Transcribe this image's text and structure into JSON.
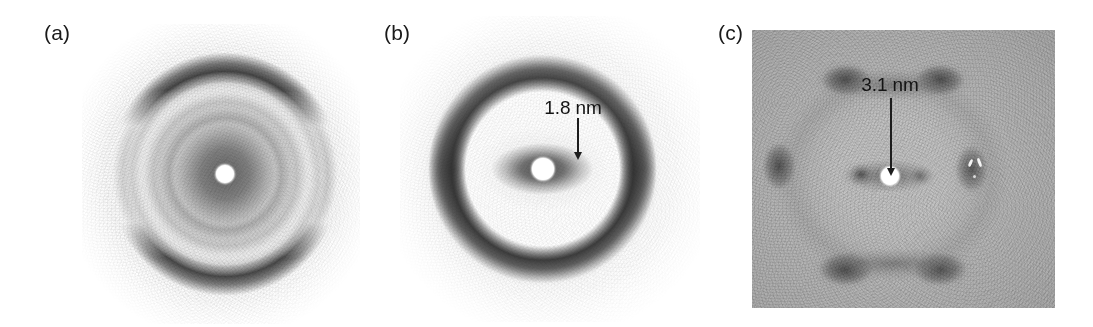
{
  "figure": {
    "background": "#ffffff",
    "width": 1093,
    "height": 327,
    "kind": "three-panel fibre X-ray diffraction patterns"
  },
  "panels": [
    {
      "id": "a",
      "label": "(a)",
      "label_x": 44,
      "label_y": 22,
      "image": {
        "x": 82,
        "y": 24,
        "w": 278,
        "h": 300
      },
      "background": "#f5f5f5",
      "edge": "soft",
      "beamstop": {
        "cx": 0.515,
        "cy": 0.5,
        "r": 9,
        "color": "#ffffff"
      },
      "description": "diffuse concentric rings with broad meridional arcs",
      "annotation": null
    },
    {
      "id": "b",
      "label": "(b)",
      "label_x": 384,
      "label_y": 22,
      "image": {
        "x": 400,
        "y": 16,
        "w": 300,
        "h": 306
      },
      "background": "#fdfdfd",
      "edge": "soft",
      "beamstop": {
        "cx": 0.475,
        "cy": 0.5,
        "r": 11,
        "color": "#ffffff"
      },
      "description": "strong outer ring with heavy top and bottom meridional arcs and a dark equatorial lobe",
      "annotation": {
        "text": "1.8 nm",
        "text_x": 573,
        "text_y": 98,
        "arrow_x": 578,
        "arrow_y": 118,
        "arrow_length": 42
      }
    },
    {
      "id": "c",
      "label": "(c)",
      "label_x": 718,
      "label_y": 22,
      "image": {
        "x": 752,
        "y": 30,
        "w": 303,
        "h": 278
      },
      "background": "#b4b4b4",
      "edge": "hard",
      "beamstop": {
        "cx": 0.455,
        "cy": 0.525,
        "r": 9,
        "color": "#ffffff"
      },
      "description": "hexagonal six-spot single-crystal-like pattern",
      "annotation": {
        "text": "3.1 nm",
        "text_x": 890,
        "text_y": 75,
        "arrow_x": 891,
        "arrow_y": 98,
        "arrow_length": 78
      }
    }
  ],
  "chart_data": {
    "type": "scatter",
    "subtitle": "",
    "xlabel": "",
    "ylabel": "",
    "panel_ids": [
      "a",
      "b",
      "c"
    ],
    "panel_labels": [
      "(a)",
      "(b)",
      "(c)"
    ],
    "annotations": [
      {
        "panel": "b",
        "text": "1.8 nm",
        "value": 1.8,
        "unit": "nm",
        "points_to": "equatorial reflection"
      },
      {
        "panel": "c",
        "text": "3.1 nm",
        "value": 3.1,
        "unit": "nm",
        "points_to": "equatorial reflection"
      }
    ],
    "features": [
      {
        "panel": "a",
        "feature": "diffuse concentric rings",
        "count": 3,
        "symmetry": "circular"
      },
      {
        "panel": "a",
        "feature": "meridional arcs",
        "count": 2,
        "symmetry": "top-bottom"
      },
      {
        "panel": "b",
        "feature": "outer ring with meridional arcs",
        "count": 2,
        "symmetry": "top-bottom"
      },
      {
        "panel": "b",
        "feature": "equatorial lobe",
        "count": 1,
        "symmetry": "horizontal"
      },
      {
        "panel": "c",
        "feature": "hexagonal reflections",
        "count": 6,
        "symmetry": "six-fold"
      }
    ],
    "legend": [],
    "grid": false
  }
}
